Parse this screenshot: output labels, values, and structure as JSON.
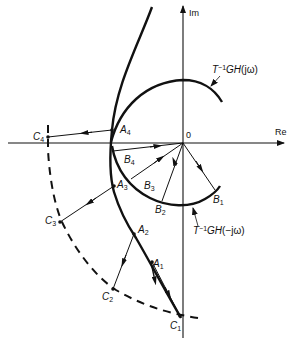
{
  "diagram": {
    "type": "nyquist-plot-construction",
    "axes": {
      "real_label": "Re",
      "imag_label": "Im",
      "origin_label": "0"
    },
    "curves": {
      "upper_locus_label_prefix": "T",
      "upper_locus_label_sup": "−1",
      "upper_locus_label_main": "GH",
      "upper_locus_label_arg": "(jω)",
      "lower_locus_label_prefix": "T",
      "lower_locus_label_sup": "−1",
      "lower_locus_label_main": "GH",
      "lower_locus_label_arg": "(−jω)"
    },
    "points": {
      "A1": {
        "letter": "A",
        "sub": "1"
      },
      "A2": {
        "letter": "A",
        "sub": "2"
      },
      "A3": {
        "letter": "A",
        "sub": "3"
      },
      "A4": {
        "letter": "A",
        "sub": "4"
      },
      "B1": {
        "letter": "B",
        "sub": "1"
      },
      "B2": {
        "letter": "B",
        "sub": "2"
      },
      "B3": {
        "letter": "B",
        "sub": "3"
      },
      "B4": {
        "letter": "B",
        "sub": "4"
      },
      "C1": {
        "letter": "C",
        "sub": "1"
      },
      "C2": {
        "letter": "C",
        "sub": "2"
      },
      "C3": {
        "letter": "C",
        "sub": "3"
      },
      "C4": {
        "letter": "C",
        "sub": "4"
      }
    },
    "colors": {
      "ink": "#111111",
      "background": "#ffffff"
    }
  }
}
